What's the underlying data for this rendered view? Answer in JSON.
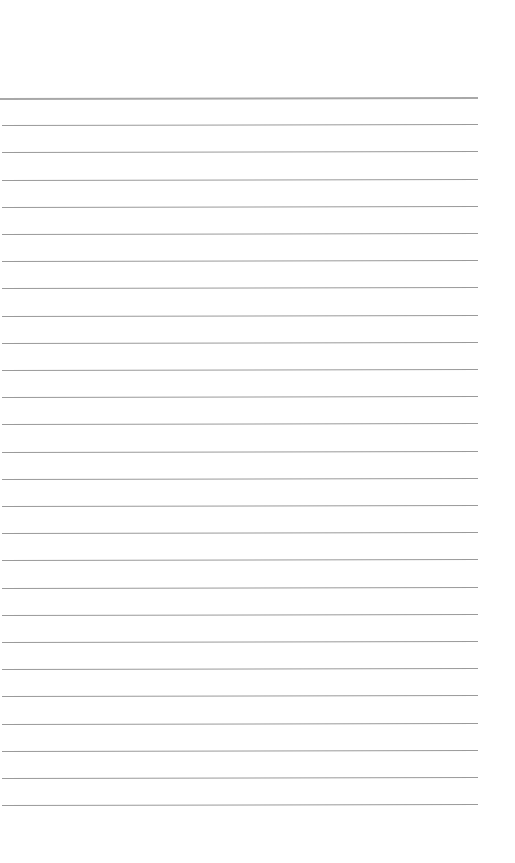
{
  "page": {
    "type": "blank-lined-paper",
    "rule_count": 27,
    "first_rule_y": 98,
    "rule_spacing": 27.2,
    "rule_color": "#9a9a9a",
    "header_rule_color": "#a8a8a8",
    "background": "#ffffff",
    "text": ""
  }
}
